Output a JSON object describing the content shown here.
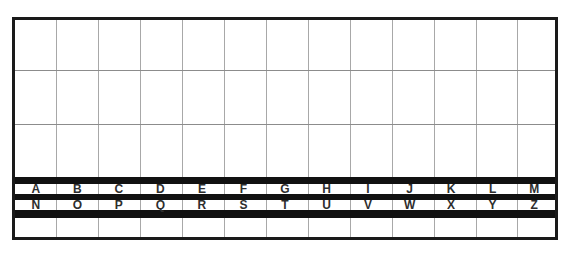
{
  "board": {
    "columns": 13,
    "rows": {
      "letters_top": [
        "A",
        "B",
        "C",
        "D",
        "E",
        "F",
        "G",
        "H",
        "I",
        "J",
        "K",
        "L",
        "M"
      ],
      "letters_bottom": [
        "N",
        "O",
        "P",
        "Q",
        "R",
        "S",
        "T",
        "U",
        "V",
        "W",
        "X",
        "Y",
        "Z"
      ]
    },
    "colors": {
      "border": "#1a1a1a",
      "band": "#111111",
      "grid_line": "#a8a8a8",
      "letter": "#2e2e2e",
      "background": "#ffffff"
    }
  }
}
